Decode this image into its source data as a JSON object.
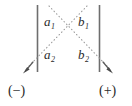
{
  "figure": {
    "background_color": "#ffffff",
    "line_color": "#6b6b6b",
    "dotted_color": "#9a9a9a",
    "text_color": "#2b2b2b",
    "plates": [
      {
        "name": "left-plate",
        "x": 37,
        "y_top": 5,
        "y_bottom": 72
      },
      {
        "name": "right-plate",
        "x": 100,
        "y_top": 5,
        "y_bottom": 72
      }
    ],
    "crossing_point": {
      "x": 68,
      "y": 40
    },
    "paths": [
      {
        "name": "upper-left-to-lower-right",
        "x1": 48,
        "y1": 6,
        "x2": 110,
        "y2": 70,
        "style": "dotted"
      },
      {
        "name": "upper-right-to-lower-left",
        "x1": 88,
        "y1": 6,
        "x2": 26,
        "y2": 70,
        "style": "dotted"
      }
    ],
    "arrows": [
      {
        "name": "arrow-to-negative",
        "direction": "down-left",
        "tip_x": 24,
        "tip_y": 72
      },
      {
        "name": "arrow-to-positive",
        "direction": "down-right",
        "tip_x": 112,
        "tip_y": 72
      }
    ],
    "labels": {
      "a1": "a",
      "a1_sub": "1",
      "b1": "b",
      "b1_sub": "1",
      "a2": "a",
      "a2_sub": "2",
      "b2": "b",
      "b2_sub": "2",
      "negative": "(−)",
      "positive": "(+)"
    }
  }
}
